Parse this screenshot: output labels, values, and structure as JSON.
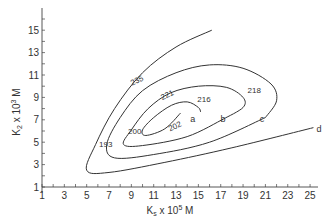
{
  "chart_data": {
    "type": "contour",
    "title": "",
    "xlabel": "Ks x 10^5 M",
    "ylabel": "K2 x 10^3 M",
    "xlim": [
      1,
      25
    ],
    "ylim": [
      1,
      15
    ],
    "x_ticks": [
      1,
      3,
      5,
      7,
      9,
      11,
      13,
      15,
      17,
      19,
      21,
      23,
      25
    ],
    "y_ticks": [
      1,
      3,
      5,
      7,
      9,
      11,
      13,
      15
    ],
    "grid": false,
    "series": [
      {
        "name": "a",
        "points": [
          [
            13.4,
            7.6
          ],
          [
            12,
            6.2
          ],
          [
            10.3,
            5.6
          ],
          [
            10,
            6.1
          ],
          [
            11,
            7.2
          ],
          [
            12.6,
            8.3
          ],
          [
            14,
            8.6
          ],
          [
            15,
            8.1
          ],
          [
            15.2,
            7.7
          ]
        ]
      },
      {
        "name": "b",
        "points": [
          [
            17.3,
            7.1
          ],
          [
            14,
            5.5
          ],
          [
            10,
            4.7
          ],
          [
            8.3,
            4.8
          ],
          [
            9,
            6.1
          ],
          [
            10.5,
            8
          ],
          [
            12.5,
            9.4
          ],
          [
            15,
            10
          ],
          [
            17.5,
            9.9
          ],
          [
            19,
            9
          ],
          [
            19,
            8.1
          ],
          [
            17.3,
            7.1
          ]
        ]
      },
      {
        "name": "c",
        "points": [
          [
            21,
            7.2
          ],
          [
            16,
            5
          ],
          [
            11,
            3.9
          ],
          [
            7.5,
            3.6
          ],
          [
            6.8,
            4.8
          ],
          [
            8,
            7.2
          ],
          [
            10,
            9.6
          ],
          [
            13,
            11.2
          ],
          [
            16,
            11.9
          ],
          [
            19,
            11.6
          ],
          [
            21.5,
            10.2
          ],
          [
            22,
            8.7
          ],
          [
            21,
            7.2
          ]
        ]
      },
      {
        "name": "d",
        "points": [
          [
            25.3,
            6.3
          ],
          [
            18,
            4.5
          ],
          [
            12,
            3.2
          ],
          [
            7,
            2.3
          ],
          [
            5,
            2.5
          ],
          [
            5.8,
            4.8
          ],
          [
            7.5,
            8
          ],
          [
            10,
            11.2
          ],
          [
            13,
            13.5
          ],
          [
            16.2,
            15
          ]
        ]
      }
    ],
    "annotations": [
      {
        "text": "235",
        "x": 9.6,
        "y": 10.3
      },
      {
        "text": "221",
        "x": 12.3,
        "y": 9.0
      },
      {
        "text": "216",
        "x": 15.5,
        "y": 8.6
      },
      {
        "text": "218",
        "x": 20.0,
        "y": 9.4
      },
      {
        "text": "200",
        "x": 9.3,
        "y": 5.7
      },
      {
        "text": "202",
        "x": 13.0,
        "y": 6.2
      },
      {
        "text": "193",
        "x": 6.7,
        "y": 4.6
      },
      {
        "text": "a",
        "x": 14.5,
        "y": 6.8
      },
      {
        "text": "b",
        "x": 17.2,
        "y": 6.8
      },
      {
        "text": "c",
        "x": 20.7,
        "y": 6.8
      },
      {
        "text": "d",
        "x": 25.8,
        "y": 5.9
      }
    ]
  }
}
